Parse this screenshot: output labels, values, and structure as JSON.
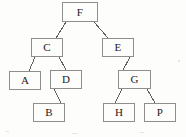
{
  "diagram": {
    "kind": "binary-tree",
    "title": "",
    "background_color": "#fdfdfc",
    "box_border_color": "#8e8e8e",
    "edge_color": "#5f5f5f",
    "text_color": "#1b1b1b",
    "nodes": [
      {
        "id": "F",
        "label": "F",
        "x": 62,
        "y": 2,
        "w": 36,
        "h": 20,
        "level": 0
      },
      {
        "id": "C",
        "label": "C",
        "x": 31,
        "y": 38,
        "w": 32,
        "h": 19,
        "level": 1
      },
      {
        "id": "E",
        "label": "E",
        "x": 102,
        "y": 38,
        "w": 32,
        "h": 19,
        "level": 1
      },
      {
        "id": "A",
        "label": "A",
        "x": 9,
        "y": 71,
        "w": 32,
        "h": 19,
        "level": 2
      },
      {
        "id": "D",
        "label": "D",
        "x": 50,
        "y": 70,
        "w": 32,
        "h": 19,
        "level": 2
      },
      {
        "id": "G",
        "label": "G",
        "x": 118,
        "y": 70,
        "w": 33,
        "h": 19,
        "level": 2
      },
      {
        "id": "B",
        "label": "B",
        "x": 33,
        "y": 103,
        "w": 32,
        "h": 19,
        "level": 3
      },
      {
        "id": "H",
        "label": "H",
        "x": 103,
        "y": 103,
        "w": 32,
        "h": 19,
        "level": 3
      },
      {
        "id": "P",
        "label": "P",
        "x": 144,
        "y": 103,
        "w": 32,
        "h": 19,
        "level": 3
      }
    ],
    "edges": [
      {
        "from": "F",
        "to": "C",
        "x1": 66,
        "y1": 22,
        "x2": 56,
        "y2": 38
      },
      {
        "from": "F",
        "to": "E",
        "x1": 94,
        "y1": 22,
        "x2": 108,
        "y2": 38
      },
      {
        "from": "C",
        "to": "A",
        "x1": 35,
        "y1": 57,
        "x2": 29,
        "y2": 71
      },
      {
        "from": "C",
        "to": "D",
        "x1": 59,
        "y1": 57,
        "x2": 66,
        "y2": 70
      },
      {
        "from": "D",
        "to": "B",
        "x1": 54,
        "y1": 89,
        "x2": 61,
        "y2": 103
      },
      {
        "from": "E",
        "to": "G",
        "x1": 130,
        "y1": 57,
        "x2": 123,
        "y2": 70
      },
      {
        "from": "G",
        "to": "H",
        "x1": 122,
        "y1": 89,
        "x2": 115,
        "y2": 103
      },
      {
        "from": "G",
        "to": "P",
        "x1": 147,
        "y1": 89,
        "x2": 155,
        "y2": 103
      }
    ]
  }
}
